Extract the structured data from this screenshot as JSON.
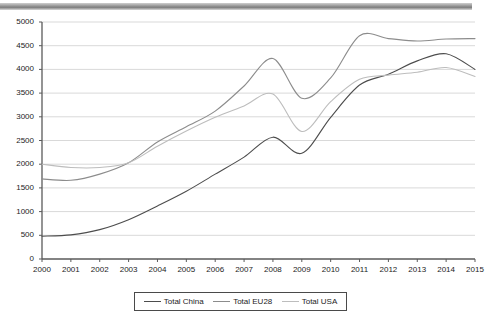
{
  "chart_data": {
    "type": "line",
    "title": "",
    "xlabel": "",
    "ylabel": "",
    "x": [
      2000,
      2001,
      2002,
      2003,
      2004,
      2005,
      2006,
      2007,
      2008,
      2009,
      2010,
      2011,
      2012,
      2013,
      2014,
      2015
    ],
    "categories": [
      "2000",
      "2001",
      "2002",
      "2003",
      "2004",
      "2005",
      "2006",
      "2007",
      "2008",
      "2009",
      "2010",
      "2011",
      "2012",
      "2013",
      "2014",
      "2015"
    ],
    "ylim": [
      0,
      5000
    ],
    "ytick_values": [
      0,
      500,
      1000,
      1500,
      2000,
      2500,
      3000,
      3500,
      4000,
      4500,
      5000
    ],
    "ytick_labels": [
      "0",
      "500",
      "1000",
      "1500",
      "2000",
      "2500",
      "3000",
      "3500",
      "4000",
      "4500",
      "5000"
    ],
    "grid": true,
    "legend_position": "bottom",
    "series": [
      {
        "name": "Total China",
        "color": "#4d4d4d",
        "values": [
          480,
          510,
          620,
          830,
          1120,
          1430,
          1790,
          2150,
          2570,
          2230,
          2990,
          3670,
          3900,
          4180,
          4330,
          4000
        ]
      },
      {
        "name": "Total EU28",
        "color": "#8c8c8c",
        "values": [
          1690,
          1660,
          1790,
          2030,
          2470,
          2790,
          3120,
          3650,
          4230,
          3390,
          3820,
          4710,
          4650,
          4600,
          4640,
          4650
        ]
      },
      {
        "name": "Total USA",
        "color": "#bdbdbd",
        "values": [
          2000,
          1930,
          1930,
          2030,
          2380,
          2700,
          2990,
          3230,
          3480,
          2690,
          3320,
          3790,
          3880,
          3940,
          4040,
          3850
        ]
      }
    ]
  },
  "legend": {
    "items": [
      {
        "label": "Total China"
      },
      {
        "label": "Total EU28"
      },
      {
        "label": "Total USA"
      }
    ]
  },
  "colors": {
    "china": "#4d4d4d",
    "eu28": "#8c8c8c",
    "usa": "#bdbdbd",
    "grid": "#d9d9d9",
    "axis": "#5a5a5a",
    "text": "#1c1c1c"
  }
}
